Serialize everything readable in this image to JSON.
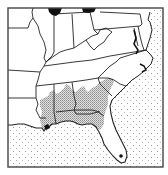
{
  "map": {
    "type": "range-map",
    "region": "Southeastern United States",
    "colors": {
      "background": "#ffffff",
      "frame": "#444444",
      "state_border": "#222222",
      "ocean_dot": "#9a9a9a",
      "range_fill": "#bdbdbd",
      "lake": "#111111",
      "locality_dot": "#111111"
    },
    "features": {
      "ocean": "stippled-ocean-pattern",
      "range": "shaded-distribution-gulf-coastal-plain",
      "lakes": [
        "lake-michigan",
        "lake-erie"
      ],
      "locality": "south-florida-record-dot"
    }
  }
}
